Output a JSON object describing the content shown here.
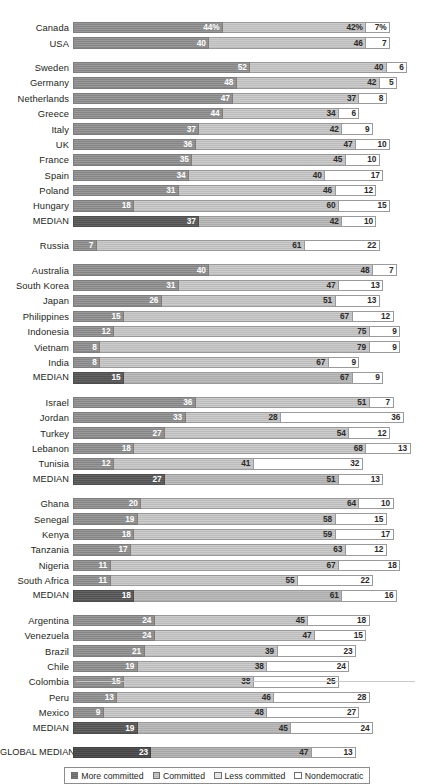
{
  "chart_data": {
    "type": "bar",
    "subtype": "stacked-horizontal-100",
    "title": "",
    "xlabel": "",
    "ylabel": "",
    "xlim": [
      0,
      100
    ],
    "grid": false,
    "legend_position": "bottom-center",
    "categories_key": "series",
    "series": [
      {
        "name": "More committed",
        "color": "#8d8d8d"
      },
      {
        "name": "Committed",
        "color": "#c2c2c2"
      },
      {
        "name": "Less committed",
        "color": "#e4e4e4"
      },
      {
        "name": "Nondemocratic",
        "color": "#ffffff"
      }
    ],
    "unit_suffix": "%",
    "groups": [
      {
        "name": "North America",
        "rows": [
          {
            "label": "Canada",
            "values": [
              44,
              42,
              7
            ],
            "labels": [
              "44%",
              "42%",
              "7%"
            ],
            "seg_classes": [
              "cat-more",
              "cat-committed",
              "cat-nondem"
            ]
          },
          {
            "label": "USA",
            "values": [
              40,
              46,
              7
            ],
            "labels": [
              "40",
              "46",
              "7"
            ],
            "seg_classes": [
              "cat-more",
              "cat-committed",
              "cat-nondem"
            ]
          }
        ]
      },
      {
        "name": "Europe",
        "rows": [
          {
            "label": "Sweden",
            "values": [
              52,
              40,
              6
            ],
            "labels": [
              "52",
              "40",
              "6"
            ],
            "seg_classes": [
              "cat-more",
              "cat-committed",
              "cat-nondem"
            ]
          },
          {
            "label": "Germany",
            "values": [
              48,
              42,
              5
            ],
            "labels": [
              "48",
              "42",
              "5"
            ],
            "seg_classes": [
              "cat-more",
              "cat-committed",
              "cat-nondem"
            ]
          },
          {
            "label": "Netherlands",
            "values": [
              47,
              37,
              8
            ],
            "labels": [
              "47",
              "37",
              "8"
            ],
            "seg_classes": [
              "cat-more",
              "cat-committed",
              "cat-nondem"
            ]
          },
          {
            "label": "Greece",
            "values": [
              44,
              34,
              6
            ],
            "labels": [
              "44",
              "34",
              "6"
            ],
            "seg_classes": [
              "cat-more",
              "cat-committed",
              "cat-nondem"
            ]
          },
          {
            "label": "Italy",
            "values": [
              37,
              42,
              9
            ],
            "labels": [
              "37",
              "42",
              "9"
            ],
            "seg_classes": [
              "cat-more",
              "cat-committed",
              "cat-nondem"
            ]
          },
          {
            "label": "UK",
            "values": [
              36,
              47,
              10
            ],
            "labels": [
              "36",
              "47",
              "10"
            ],
            "seg_classes": [
              "cat-more",
              "cat-committed",
              "cat-nondem"
            ]
          },
          {
            "label": "France",
            "values": [
              35,
              45,
              10
            ],
            "labels": [
              "35",
              "45",
              "10"
            ],
            "seg_classes": [
              "cat-more",
              "cat-committed",
              "cat-nondem"
            ]
          },
          {
            "label": "Spain",
            "values": [
              34,
              40,
              17
            ],
            "labels": [
              "34",
              "40",
              "17"
            ],
            "seg_classes": [
              "cat-more",
              "cat-committed",
              "cat-nondem"
            ]
          },
          {
            "label": "Poland",
            "values": [
              31,
              46,
              12
            ],
            "labels": [
              "31",
              "46",
              "12"
            ],
            "seg_classes": [
              "cat-more",
              "cat-committed",
              "cat-nondem"
            ]
          },
          {
            "label": "Hungary",
            "values": [
              18,
              60,
              15
            ],
            "labels": [
              "18",
              "60",
              "15"
            ],
            "seg_classes": [
              "cat-more",
              "cat-committed",
              "cat-nondem"
            ]
          },
          {
            "label": "MEDIAN",
            "values": [
              37,
              42,
              10
            ],
            "labels": [
              "37",
              "42",
              "10"
            ],
            "seg_classes": [
              "cat-more",
              "cat-committed",
              "cat-nondem"
            ],
            "median": true
          }
        ]
      },
      {
        "name": "Russia",
        "rows": [
          {
            "label": "Russia",
            "values": [
              7,
              61,
              22
            ],
            "labels": [
              "7",
              "61",
              "22"
            ],
            "seg_classes": [
              "cat-more",
              "cat-committed",
              "cat-nondem"
            ]
          }
        ]
      },
      {
        "name": "Asia-Pacific",
        "rows": [
          {
            "label": "Australia",
            "values": [
              40,
              48,
              7
            ],
            "labels": [
              "40",
              "48",
              "7"
            ],
            "seg_classes": [
              "cat-more",
              "cat-committed",
              "cat-nondem"
            ]
          },
          {
            "label": "South Korea",
            "values": [
              31,
              47,
              13
            ],
            "labels": [
              "31",
              "47",
              "13"
            ],
            "seg_classes": [
              "cat-more",
              "cat-committed",
              "cat-nondem"
            ]
          },
          {
            "label": "Japan",
            "values": [
              26,
              51,
              13
            ],
            "labels": [
              "26",
              "51",
              "13"
            ],
            "seg_classes": [
              "cat-more",
              "cat-committed",
              "cat-nondem"
            ]
          },
          {
            "label": "Philippines",
            "values": [
              15,
              67,
              12
            ],
            "labels": [
              "15",
              "67",
              "12"
            ],
            "seg_classes": [
              "cat-more",
              "cat-committed",
              "cat-nondem"
            ]
          },
          {
            "label": "Indonesia",
            "values": [
              12,
              75,
              9
            ],
            "labels": [
              "12",
              "75",
              "9"
            ],
            "seg_classes": [
              "cat-more",
              "cat-committed",
              "cat-nondem"
            ]
          },
          {
            "label": "Vietnam",
            "values": [
              8,
              79,
              9
            ],
            "labels": [
              "8",
              "79",
              "9"
            ],
            "seg_classes": [
              "cat-more",
              "cat-committed",
              "cat-nondem"
            ]
          },
          {
            "label": "India",
            "values": [
              8,
              67,
              9
            ],
            "labels": [
              "8",
              "67",
              "9"
            ],
            "seg_classes": [
              "cat-more",
              "cat-committed",
              "cat-nondem"
            ]
          },
          {
            "label": "MEDIAN",
            "values": [
              15,
              67,
              9
            ],
            "labels": [
              "15",
              "67",
              "9"
            ],
            "seg_classes": [
              "cat-more",
              "cat-committed",
              "cat-nondem"
            ],
            "median": true
          }
        ]
      },
      {
        "name": "Middle East",
        "rows": [
          {
            "label": "Israel",
            "values": [
              36,
              51,
              7
            ],
            "labels": [
              "36",
              "51",
              "7"
            ],
            "seg_classes": [
              "cat-more",
              "cat-committed",
              "cat-nondem"
            ]
          },
          {
            "label": "Jordan",
            "values": [
              33,
              28,
              36
            ],
            "labels": [
              "33",
              "28",
              "36"
            ],
            "seg_classes": [
              "cat-more",
              "cat-committed",
              "cat-nondem"
            ]
          },
          {
            "label": "Turkey",
            "values": [
              27,
              54,
              12
            ],
            "labels": [
              "27",
              "54",
              "12"
            ],
            "seg_classes": [
              "cat-more",
              "cat-committed",
              "cat-nondem"
            ]
          },
          {
            "label": "Lebanon",
            "values": [
              18,
              68,
              13
            ],
            "labels": [
              "18",
              "68",
              "13"
            ],
            "seg_classes": [
              "cat-more",
              "cat-committed",
              "cat-nondem"
            ]
          },
          {
            "label": "Tunisia",
            "values": [
              12,
              41,
              32
            ],
            "labels": [
              "12",
              "41",
              "32"
            ],
            "seg_classes": [
              "cat-more",
              "cat-committed",
              "cat-nondem"
            ]
          },
          {
            "label": "MEDIAN",
            "values": [
              27,
              51,
              13
            ],
            "labels": [
              "27",
              "51",
              "13"
            ],
            "seg_classes": [
              "cat-more",
              "cat-committed",
              "cat-nondem"
            ],
            "median": true
          }
        ]
      },
      {
        "name": "Africa",
        "rows": [
          {
            "label": "Ghana",
            "values": [
              20,
              64,
              10
            ],
            "labels": [
              "20",
              "64",
              "10"
            ],
            "seg_classes": [
              "cat-more",
              "cat-committed",
              "cat-nondem"
            ]
          },
          {
            "label": "Senegal",
            "values": [
              19,
              58,
              15
            ],
            "labels": [
              "19",
              "58",
              "15"
            ],
            "seg_classes": [
              "cat-more",
              "cat-committed",
              "cat-nondem"
            ]
          },
          {
            "label": "Kenya",
            "values": [
              18,
              59,
              17
            ],
            "labels": [
              "18",
              "59",
              "17"
            ],
            "seg_classes": [
              "cat-more",
              "cat-committed",
              "cat-nondem"
            ]
          },
          {
            "label": "Tanzania",
            "values": [
              17,
              63,
              12
            ],
            "labels": [
              "17",
              "63",
              "12"
            ],
            "seg_classes": [
              "cat-more",
              "cat-committed",
              "cat-nondem"
            ]
          },
          {
            "label": "Nigeria",
            "values": [
              11,
              67,
              18
            ],
            "labels": [
              "11",
              "67",
              "18"
            ],
            "seg_classes": [
              "cat-more",
              "cat-committed",
              "cat-nondem"
            ]
          },
          {
            "label": "South Africa",
            "values": [
              11,
              55,
              22
            ],
            "labels": [
              "11",
              "55",
              "22"
            ],
            "seg_classes": [
              "cat-more",
              "cat-committed",
              "cat-nondem"
            ]
          },
          {
            "label": "MEDIAN",
            "values": [
              18,
              61,
              16
            ],
            "labels": [
              "18",
              "61",
              "16"
            ],
            "seg_classes": [
              "cat-more",
              "cat-committed",
              "cat-nondem"
            ],
            "median": true
          }
        ]
      },
      {
        "name": "Latin America",
        "rows": [
          {
            "label": "Argentina",
            "values": [
              24,
              45,
              18
            ],
            "labels": [
              "24",
              "45",
              "18"
            ],
            "seg_classes": [
              "cat-more",
              "cat-committed",
              "cat-nondem"
            ]
          },
          {
            "label": "Venezuela",
            "values": [
              24,
              47,
              15
            ],
            "labels": [
              "24",
              "47",
              "15"
            ],
            "seg_classes": [
              "cat-more",
              "cat-committed",
              "cat-nondem"
            ]
          },
          {
            "label": "Brazil",
            "values": [
              21,
              39,
              23
            ],
            "labels": [
              "21",
              "39",
              "23"
            ],
            "seg_classes": [
              "cat-more",
              "cat-committed",
              "cat-nondem"
            ]
          },
          {
            "label": "Chile",
            "values": [
              19,
              38,
              24
            ],
            "labels": [
              "19",
              "38",
              "24"
            ],
            "seg_classes": [
              "cat-more",
              "cat-committed",
              "cat-nondem"
            ]
          },
          {
            "label": "Colombia",
            "values": [
              15,
              38,
              25
            ],
            "labels": [
              "15",
              "38",
              "25"
            ],
            "seg_classes": [
              "cat-more",
              "cat-committed",
              "cat-nondem"
            ]
          },
          {
            "label": "Peru",
            "values": [
              13,
              46,
              28
            ],
            "labels": [
              "13",
              "46",
              "28"
            ],
            "seg_classes": [
              "cat-more",
              "cat-committed",
              "cat-nondem"
            ]
          },
          {
            "label": "Mexico",
            "values": [
              9,
              48,
              27
            ],
            "labels": [
              "9",
              "48",
              "27"
            ],
            "seg_classes": [
              "cat-more",
              "cat-committed",
              "cat-nondem"
            ]
          },
          {
            "label": "MEDIAN",
            "values": [
              19,
              45,
              24
            ],
            "labels": [
              "19",
              "45",
              "24"
            ],
            "seg_classes": [
              "cat-more",
              "cat-committed",
              "cat-nondem"
            ],
            "median": true
          }
        ]
      },
      {
        "name": "Global",
        "rows": [
          {
            "label": "GLOBAL MEDIAN",
            "values": [
              23,
              47,
              13
            ],
            "labels": [
              "23",
              "47",
              "13"
            ],
            "seg_classes": [
              "cat-more",
              "cat-committed",
              "cat-nondem"
            ],
            "global": true
          }
        ]
      }
    ],
    "legend": [
      {
        "label": "More committed",
        "swatch": "sw-more"
      },
      {
        "label": "Committed",
        "swatch": "sw-committed"
      },
      {
        "label": "Less committed",
        "swatch": "sw-less"
      },
      {
        "label": "Nondemocratic",
        "swatch": "sw-nondem"
      }
    ]
  }
}
